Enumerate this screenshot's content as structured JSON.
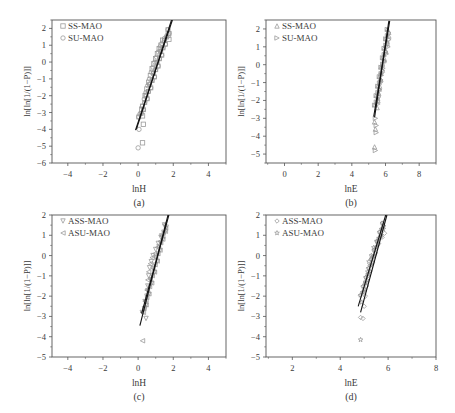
{
  "figure": {
    "panels": [
      {
        "id": "a",
        "caption": "(a)"
      },
      {
        "id": "b",
        "caption": "(b)"
      },
      {
        "id": "c",
        "caption": "(c)"
      },
      {
        "id": "d",
        "caption": "(d)"
      }
    ]
  },
  "colors": {
    "axis": "#555555",
    "fit_line": "#111111",
    "marker": "#9a9a9a",
    "text": "#3a3a3a"
  },
  "chart_data": [
    {
      "panel": "a",
      "caption": "(a)",
      "type": "scatter",
      "xlabel": "lnH",
      "ylabel": "ln[ln[1/(1−P)]]",
      "xlim": [
        -4.9,
        5.0
      ],
      "ylim": [
        -6,
        2.5
      ],
      "xticks": [
        -4,
        -2,
        0,
        2,
        4
      ],
      "yticks": [
        2,
        1,
        0,
        -1,
        -2,
        -3,
        -4,
        -5,
        -6
      ],
      "grid": false,
      "legend_position": "upper left",
      "frame": {
        "x": 52,
        "y": 20,
        "w": 174,
        "h": 143
      },
      "series": [
        {
          "name": "SS-MAO",
          "marker": "square",
          "points": [
            [
              0.2,
              -2.8
            ],
            [
              0.25,
              -3.2
            ],
            [
              0.3,
              -3.7
            ],
            [
              0.25,
              -4.8
            ],
            [
              0.4,
              -2.0
            ],
            [
              0.5,
              -1.6
            ],
            [
              0.6,
              -1.2
            ],
            [
              0.7,
              -0.8
            ],
            [
              0.8,
              -0.4
            ],
            [
              0.9,
              -0.1
            ],
            [
              1.0,
              0.2
            ],
            [
              1.1,
              0.5
            ],
            [
              1.2,
              0.8
            ],
            [
              1.3,
              1.0
            ],
            [
              1.4,
              1.3
            ],
            [
              1.7,
              1.6
            ],
            [
              1.75,
              1.35
            ]
          ]
        },
        {
          "name": "SU-MAO",
          "marker": "circle",
          "points": [
            [
              0.1,
              -3.1
            ],
            [
              0.05,
              -4.0
            ],
            [
              0.0,
              -5.1
            ],
            [
              0.35,
              -2.2
            ],
            [
              0.45,
              -1.8
            ],
            [
              0.55,
              -1.4
            ],
            [
              0.65,
              -1.0
            ],
            [
              0.75,
              -0.6
            ],
            [
              0.85,
              -0.3
            ],
            [
              0.95,
              0.0
            ],
            [
              1.05,
              0.3
            ],
            [
              1.15,
              0.6
            ],
            [
              1.25,
              0.9
            ],
            [
              1.35,
              1.1
            ],
            [
              1.5,
              1.4
            ]
          ]
        }
      ],
      "fit_lines": [
        {
          "x1": -0.15,
          "y1": -4.05,
          "x2": 1.95,
          "y2": 2.5
        },
        {
          "x1": -0.1,
          "y1": -4.0,
          "x2": 1.9,
          "y2": 2.5
        }
      ]
    },
    {
      "panel": "b",
      "caption": "(b)",
      "type": "scatter",
      "xlabel": "lnE",
      "ylabel": "ln[ln[1/(1−P)]]",
      "xlim": [
        -1.1,
        9.0
      ],
      "ylim": [
        -5.5,
        2.5
      ],
      "xticks": [
        0,
        2,
        4,
        6,
        8
      ],
      "yticks": [
        2,
        1,
        0,
        -1,
        -2,
        -3,
        -4,
        -5
      ],
      "grid": false,
      "legend_position": "upper left",
      "frame": {
        "x": 266,
        "y": 20,
        "w": 170,
        "h": 143
      },
      "series": [
        {
          "name": "SS-MAO",
          "marker": "triangle-up",
          "points": [
            [
              5.35,
              -3.2
            ],
            [
              5.4,
              -3.6
            ],
            [
              5.35,
              -4.6
            ],
            [
              5.5,
              -2.4
            ],
            [
              5.55,
              -2.0
            ],
            [
              5.6,
              -1.6
            ],
            [
              5.65,
              -1.2
            ],
            [
              5.7,
              -0.8
            ],
            [
              5.75,
              -0.4
            ],
            [
              5.8,
              0.0
            ],
            [
              5.9,
              0.4
            ],
            [
              6.0,
              0.8
            ],
            [
              6.1,
              1.2
            ],
            [
              6.2,
              1.6
            ]
          ]
        },
        {
          "name": "SU-MAO",
          "marker": "triangle-right",
          "points": [
            [
              5.4,
              -3.0
            ],
            [
              5.45,
              -3.4
            ],
            [
              5.45,
              -3.8
            ],
            [
              5.4,
              -4.8
            ],
            [
              5.55,
              -2.2
            ],
            [
              5.6,
              -1.8
            ],
            [
              5.65,
              -1.4
            ],
            [
              5.7,
              -1.0
            ],
            [
              5.75,
              -0.6
            ],
            [
              5.85,
              -0.2
            ],
            [
              5.95,
              0.2
            ],
            [
              6.05,
              0.6
            ],
            [
              6.15,
              1.0
            ],
            [
              6.2,
              1.4
            ]
          ]
        }
      ],
      "fit_lines": [
        {
          "x1": 5.3,
          "y1": -2.9,
          "x2": 6.25,
          "y2": 2.45
        },
        {
          "x1": 5.35,
          "y1": -2.95,
          "x2": 6.2,
          "y2": 2.45
        }
      ]
    },
    {
      "panel": "c",
      "caption": "(c)",
      "type": "scatter",
      "xlabel": "lnH",
      "ylabel": "ln[ln[1/(1−P)]]",
      "xlim": [
        -4.9,
        5.0
      ],
      "ylim": [
        -5,
        2
      ],
      "xticks": [
        -4,
        -2,
        0,
        2,
        4
      ],
      "yticks": [
        2,
        1,
        0,
        -1,
        -2,
        -3,
        -4,
        -5
      ],
      "grid": false,
      "legend_position": "upper left",
      "frame": {
        "x": 52,
        "y": 215,
        "w": 174,
        "h": 142
      },
      "series": [
        {
          "name": "ASS-MAO",
          "marker": "triangle-down",
          "points": [
            [
              0.4,
              -2.6
            ],
            [
              0.45,
              -3.1
            ],
            [
              0.5,
              -2.0
            ],
            [
              0.55,
              -1.5
            ],
            [
              0.6,
              -1.0
            ],
            [
              0.65,
              -0.6
            ],
            [
              0.75,
              -0.3
            ],
            [
              0.85,
              0.0
            ],
            [
              1.0,
              0.3
            ],
            [
              1.15,
              0.6
            ],
            [
              1.3,
              0.9
            ],
            [
              1.5,
              1.1
            ],
            [
              1.6,
              1.4
            ]
          ]
        },
        {
          "name": "ASU-MAO",
          "marker": "triangle-left",
          "points": [
            [
              0.25,
              -4.2
            ],
            [
              0.3,
              -2.8
            ],
            [
              0.45,
              -2.2
            ],
            [
              0.5,
              -1.7
            ],
            [
              0.55,
              -1.2
            ],
            [
              0.6,
              -0.8
            ],
            [
              0.7,
              -0.4
            ],
            [
              0.8,
              -0.1
            ],
            [
              0.95,
              0.1
            ],
            [
              1.1,
              0.4
            ],
            [
              1.25,
              0.7
            ],
            [
              1.4,
              0.95
            ],
            [
              1.55,
              1.2
            ]
          ]
        }
      ],
      "fit_lines": [
        {
          "x1": 0.1,
          "y1": -3.45,
          "x2": 1.7,
          "y2": 2.0
        },
        {
          "x1": 0.2,
          "y1": -2.85,
          "x2": 1.75,
          "y2": 2.0
        }
      ]
    },
    {
      "panel": "d",
      "caption": "(d)",
      "type": "scatter",
      "xlabel": "lnE",
      "ylabel": "ln[ln[1/(1−P)]]",
      "xlim": [
        0.9,
        8.0
      ],
      "ylim": [
        -5,
        2
      ],
      "xticks": [
        2,
        4,
        6,
        8
      ],
      "yticks": [
        2,
        1,
        0,
        -1,
        -2,
        -3,
        -4,
        -5
      ],
      "grid": false,
      "legend_position": "upper left",
      "frame": {
        "x": 266,
        "y": 215,
        "w": 170,
        "h": 142
      },
      "series": [
        {
          "name": "ASS-MAO",
          "marker": "diamond",
          "points": [
            [
              4.85,
              -3.05
            ],
            [
              4.95,
              -3.1
            ],
            [
              5.0,
              -2.5
            ],
            [
              5.05,
              -2.0
            ],
            [
              5.1,
              -1.5
            ],
            [
              5.15,
              -1.0
            ],
            [
              5.25,
              -0.5
            ],
            [
              5.35,
              -0.1
            ],
            [
              5.45,
              0.3
            ],
            [
              5.6,
              0.6
            ],
            [
              5.75,
              0.9
            ],
            [
              5.85,
              1.1
            ]
          ]
        },
        {
          "name": "ASU-MAO",
          "marker": "star",
          "points": [
            [
              4.85,
              -4.15
            ],
            [
              4.9,
              -2.3
            ],
            [
              5.0,
              -1.8
            ],
            [
              5.05,
              -1.3
            ],
            [
              5.15,
              -0.8
            ],
            [
              5.2,
              -0.3
            ],
            [
              5.3,
              0.0
            ],
            [
              5.4,
              0.4
            ],
            [
              5.55,
              0.7
            ],
            [
              5.7,
              0.95
            ],
            [
              5.8,
              1.3
            ]
          ]
        }
      ],
      "fit_lines": [
        {
          "x1": 4.75,
          "y1": -2.5,
          "x2": 5.9,
          "y2": 2.0
        },
        {
          "x1": 4.85,
          "y1": -2.8,
          "x2": 5.95,
          "y2": 2.0
        }
      ]
    }
  ]
}
